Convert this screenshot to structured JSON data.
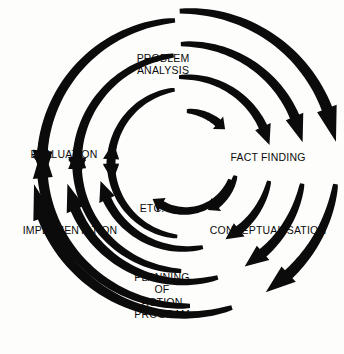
{
  "diagram": {
    "type": "cycle-diagram",
    "background_color": "#fdfdfc",
    "arc_color": "#0b0b0b",
    "text_color": "#0b0b0b",
    "center": {
      "x": 185,
      "y": 163
    },
    "stages": [
      {
        "id": "problem-analysis",
        "label": "PROBLEM\nANALYSIS",
        "position": {
          "x": 163,
          "y": 64
        },
        "angle_deg": 270
      },
      {
        "id": "fact-finding",
        "label": "FACT FINDING",
        "position": {
          "x": 268,
          "y": 157
        },
        "angle_deg": 0
      },
      {
        "id": "conceptualisation",
        "label": "CONCEPTUALISATION",
        "position": {
          "x": 268,
          "y": 230
        },
        "angle_deg": 35
      },
      {
        "id": "planning-of-action-program",
        "label": "PLANNING\nOF\nACTION\nPROGRAM",
        "position": {
          "x": 162,
          "y": 296
        },
        "angle_deg": 90
      },
      {
        "id": "implementation",
        "label": "IMPLEMENTATION",
        "position": {
          "x": 70,
          "y": 230
        },
        "angle_deg": 145
      },
      {
        "id": "evaluation",
        "label": "EVALUATION",
        "position": {
          "x": 64,
          "y": 154
        },
        "angle_deg": 180
      },
      {
        "id": "etc",
        "label": "ETC.",
        "position": {
          "x": 152,
          "y": 208
        },
        "angle_deg": 115
      }
    ],
    "arc_groups": [
      {
        "id": "evaluation-to-problem-analysis",
        "quadrant": "top-left",
        "from": "evaluation",
        "to": "problem-analysis",
        "arc_count": 3,
        "radii": [
          143,
          108,
          74
        ],
        "start_deg": 183,
        "end_deg": 263,
        "thicknesses": [
          9.5,
          8.5,
          7.5
        ]
      },
      {
        "id": "problem-analysis-to-fact-finding",
        "quadrant": "top-right",
        "from": "problem-analysis",
        "to": "fact-finding",
        "arc_count": 4,
        "radii": [
          152,
          119,
          86,
          52
        ],
        "start_deg": 272,
        "end_deg": 354,
        "thicknesses": [
          10,
          9,
          8.5,
          8
        ]
      },
      {
        "id": "fact-finding-to-conceptualisation",
        "quadrant": "right",
        "from": "fact-finding",
        "to": "conceptualisation",
        "arc_count": 4,
        "radii": [
          152,
          119,
          86,
          52
        ],
        "start_deg": 6,
        "end_deg": 56,
        "thicknesses": [
          10,
          9,
          8.5,
          8
        ]
      },
      {
        "id": "conceptualisation-to-planning",
        "quadrant": "bottom-right",
        "from": "conceptualisation",
        "to": "planning-of-action-program",
        "arc_count": 3,
        "radii": [
          152,
          119,
          86
        ],
        "start_deg": 62,
        "end_deg": 110,
        "thicknesses": [
          10,
          9,
          8.5
        ]
      },
      {
        "id": "planning-to-implementation",
        "quadrant": "bottom-left",
        "from": "planning-of-action-program",
        "to": "implementation",
        "arc_count": 3,
        "radii": [
          143,
          108,
          74
        ],
        "start_deg": 118,
        "end_deg": 176,
        "thicknesses": [
          9.5,
          8.5,
          7.5
        ]
      },
      {
        "id": "implementation-to-evaluation",
        "quadrant": "left",
        "from": "implementation",
        "to": "evaluation",
        "arc_count": 3,
        "radii": [
          143,
          108,
          74
        ],
        "start_deg": 182,
        "end_deg": 178,
        "thicknesses": [
          9.5,
          8.5,
          7.5
        ]
      },
      {
        "id": "inner-loop-to-etc",
        "quadrant": "center",
        "from": "fact-finding",
        "to": "etc",
        "arc_count": 1,
        "radii": [
          48
        ],
        "start_deg": 18,
        "end_deg": 128,
        "thicknesses": [
          8
        ]
      }
    ]
  }
}
